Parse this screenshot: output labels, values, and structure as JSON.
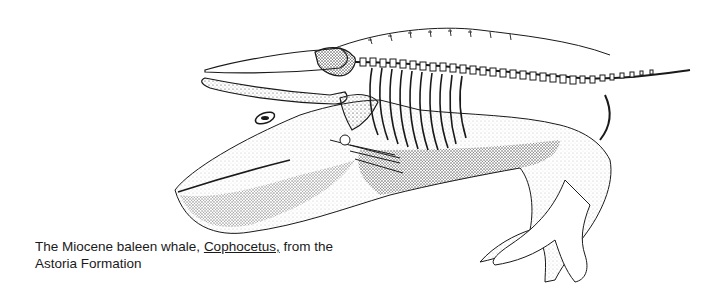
{
  "figure": {
    "colors": {
      "ink": "#1a1a1a",
      "background": "#ffffff",
      "stipple": "#555555"
    }
  },
  "caption": {
    "prefix": "The Miocene baleen whale,",
    "genus": "Cophocetus,",
    "suffix": "from the",
    "line2": "Astoria Formation"
  }
}
